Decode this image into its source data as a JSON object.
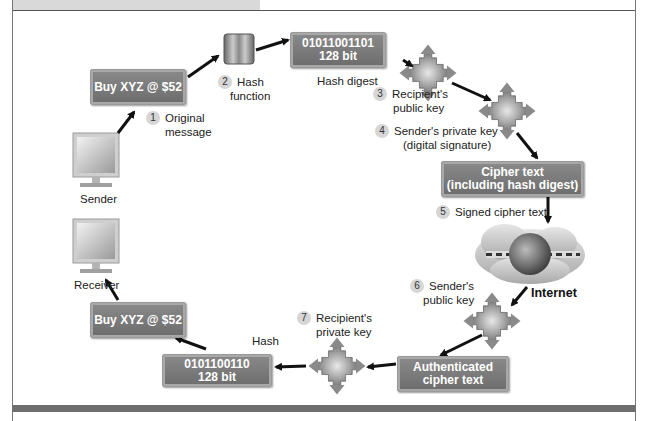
{
  "diagram": {
    "type": "digital-signature-workflow",
    "colors": {
      "box_fill": "#7a7a7a",
      "box_text": "#ffffff",
      "arrow": "#111111",
      "frame_bar": "#6e6e6e",
      "step_badge": "#d6d6d6"
    },
    "nodes": {
      "sender": {
        "label": "Sender",
        "icon": "monitor-icon"
      },
      "receiver": {
        "label": "Receiver",
        "icon": "monitor-icon"
      },
      "message_out": {
        "text": "Buy XYZ @ $52"
      },
      "hash_function_icon": {
        "icon": "hash-function-cylinder-icon"
      },
      "hash_digest_box": {
        "line1": "01011001101",
        "line2": "128 bit",
        "caption": "Hash digest"
      },
      "key_recipient_public": {
        "icon": "key-transform-icon"
      },
      "key_sender_private": {
        "icon": "key-transform-icon"
      },
      "cipher_box": {
        "line1": "Cipher text",
        "line2": "(including hash digest)"
      },
      "internet": {
        "label": "Internet",
        "icon": "internet-cloud-globe-icon"
      },
      "key_sender_public": {
        "icon": "key-transform-icon"
      },
      "authenticated_box": {
        "line1": "Authenticated",
        "line2": "cipher text"
      },
      "key_recipient_private": {
        "icon": "key-transform-icon"
      },
      "hash_result_box": {
        "line1": "0101100110",
        "line2": "128 bit",
        "caption": "Hash"
      },
      "message_in": {
        "text": "Buy XYZ @ $52"
      }
    },
    "steps": [
      {
        "num": "1",
        "line1": "Original",
        "line2": "message"
      },
      {
        "num": "2",
        "line1": "Hash",
        "line2": "function"
      },
      {
        "num": "3",
        "line1": "Recipient's",
        "line2": "public key"
      },
      {
        "num": "4",
        "line1": "Sender's private key",
        "line2": "(digital signature)"
      },
      {
        "num": "5",
        "line1": "Signed cipher text",
        "line2": ""
      },
      {
        "num": "6",
        "line1": "Sender's",
        "line2": "public key"
      },
      {
        "num": "7",
        "line1": "Recipient's",
        "line2": "private key"
      }
    ]
  }
}
